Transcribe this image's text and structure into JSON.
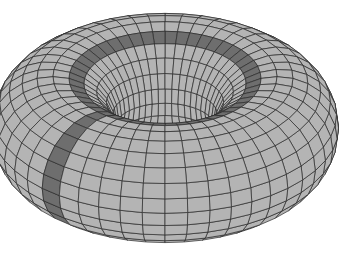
{
  "figure": {
    "colors": {
      "background": "#ffffff",
      "surface": "#b4b4b4",
      "highlight_band": "#6e6e6e",
      "mesh_line": "#2a2a2a"
    },
    "mesh": {
      "major_segments": 48,
      "minor_segments": 24
    },
    "highlighted_bands": [
      {
        "type": "parallel",
        "description": "ring around the top of the torus"
      },
      {
        "type": "meridian",
        "description": "loop around the tube on the left-front side"
      }
    ]
  }
}
